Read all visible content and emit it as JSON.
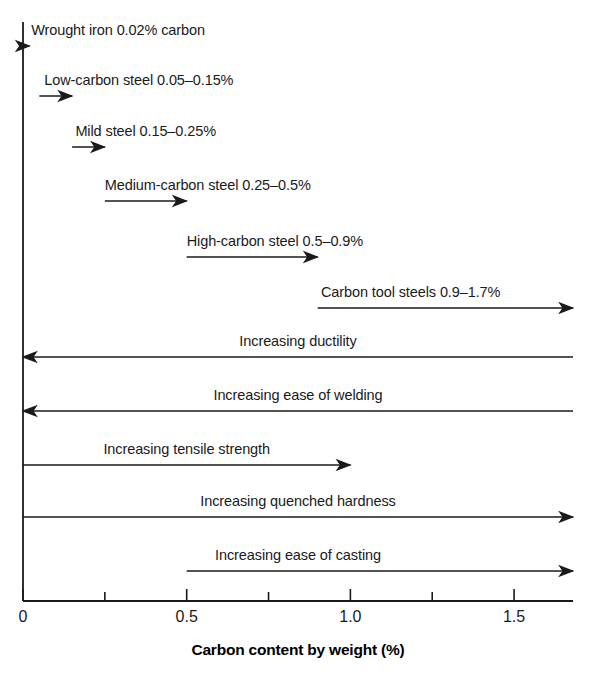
{
  "chart_data": {
    "type": "bar",
    "title": "",
    "subtitle": "",
    "xlabel": "Carbon content by weight (%)",
    "ylabel": "",
    "xlim": [
      0,
      1.68
    ],
    "grid": false,
    "legend": null,
    "orientation": "horizontal",
    "x_ticks": [
      {
        "value": 0,
        "label": "0",
        "major": true
      },
      {
        "value": 0.25,
        "label": "",
        "major": false
      },
      {
        "value": 0.5,
        "label": "0.5",
        "major": true
      },
      {
        "value": 0.75,
        "label": "",
        "major": false
      },
      {
        "value": 1.0,
        "label": "1.0",
        "major": true
      },
      {
        "value": 1.25,
        "label": "",
        "major": false
      },
      {
        "value": 1.5,
        "label": "1.5",
        "major": true
      }
    ],
    "series": [
      {
        "name": "Wrought iron 0.02% carbon",
        "label": "Wrought iron 0.02% carbon",
        "group": "steel-grade",
        "start": 0.0,
        "end": 0.02,
        "direction": "right",
        "label_x": 0.025,
        "row": 0
      },
      {
        "name": "Low-carbon steel 0.05–0.15%",
        "label": "Low-carbon steel 0.05–0.15%",
        "group": "steel-grade",
        "start": 0.05,
        "end": 0.15,
        "direction": "right",
        "label_x": 0.065,
        "row": 1
      },
      {
        "name": "Mild steel 0.15–0.25%",
        "label": "Mild steel 0.15–0.25%",
        "group": "steel-grade",
        "start": 0.15,
        "end": 0.25,
        "direction": "right",
        "label_x": 0.16,
        "row": 2
      },
      {
        "name": "Medium-carbon steel 0.25–0.5%",
        "label": "Medium-carbon steel 0.25–0.5%",
        "group": "steel-grade",
        "start": 0.25,
        "end": 0.5,
        "direction": "right",
        "label_x": 0.25,
        "row": 3
      },
      {
        "name": "High-carbon steel 0.5–0.9%",
        "label": "High-carbon steel 0.5–0.9%",
        "group": "steel-grade",
        "start": 0.5,
        "end": 0.9,
        "direction": "right",
        "label_x": 0.5,
        "row": 4
      },
      {
        "name": "Carbon tool steels 0.9–1.7%",
        "label": "Carbon tool steels 0.9–1.7%",
        "group": "steel-grade",
        "start": 0.9,
        "end": 1.68,
        "direction": "right",
        "label_x": 0.91,
        "row": 5
      },
      {
        "name": "Increasing ductility",
        "label": "Increasing ductility",
        "group": "property-trend",
        "start": 1.68,
        "end": 0.0,
        "direction": "left",
        "label_x": 0.84,
        "row": 6
      },
      {
        "name": "Increasing ease of welding",
        "label": "Increasing ease of welding",
        "group": "property-trend",
        "start": 1.68,
        "end": 0.0,
        "direction": "left",
        "label_x": 0.84,
        "row": 7
      },
      {
        "name": "Increasing tensile strength",
        "label": "Increasing tensile strength",
        "group": "property-trend",
        "start": 0.0,
        "end": 1.0,
        "direction": "right",
        "label_x": 0.5,
        "row": 8
      },
      {
        "name": "Increasing quenched hardness",
        "label": "Increasing quenched hardness",
        "group": "property-trend",
        "start": 0.0,
        "end": 1.68,
        "direction": "right",
        "label_x": 0.84,
        "row": 9
      },
      {
        "name": "Increasing ease of casting",
        "label": "Increasing ease of casting",
        "group": "property-trend",
        "start": 0.5,
        "end": 1.68,
        "direction": "right",
        "label_x": 0.84,
        "row": 10
      }
    ],
    "colors": {
      "background": "#ffffff",
      "line": "#1a1a1a",
      "text": "#1a1a1a",
      "axis": "#1a1a1a"
    }
  }
}
